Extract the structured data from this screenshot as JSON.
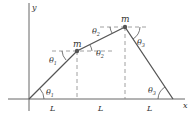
{
  "diagram": {
    "axes": {
      "x_label": "x",
      "y_label": "y"
    },
    "masses": [
      {
        "label": "m"
      },
      {
        "label": "m"
      }
    ],
    "angles": {
      "theta1_bottom": "θ",
      "theta1_bottom_sub": "1",
      "theta1_top": "θ",
      "theta1_top_sub": "1",
      "theta2_top": "θ",
      "theta2_top_sub": "2",
      "theta2_bottom": "θ",
      "theta2_bottom_sub": "2",
      "theta3_top": "θ",
      "theta3_top_sub": "3",
      "theta3_bottom": "θ",
      "theta3_bottom_sub": "3"
    },
    "segments": [
      {
        "label": "L"
      },
      {
        "label": "L"
      },
      {
        "label": "L"
      }
    ],
    "colors": {
      "rope": "#555555",
      "axis": "#666666",
      "dashed": "#888888",
      "mass": "#555555"
    }
  }
}
